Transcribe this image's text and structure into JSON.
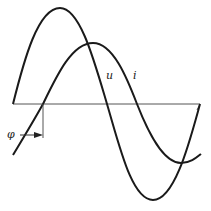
{
  "diagram": {
    "type": "phase-shift sine waveforms",
    "labels": {
      "voltage": "u",
      "current": "i",
      "phase": "φ"
    },
    "colors": {
      "line": "#1a1a1a",
      "axis": "#555555",
      "background": "#ffffff"
    },
    "axis": {
      "y": 104,
      "x_start": 13,
      "x_end": 200
    },
    "curves": [
      {
        "name": "u",
        "description": "leading sine wave, larger amplitude, starts at axis"
      },
      {
        "name": "i",
        "description": "lagging sine wave, smaller amplitude, shifted by φ"
      }
    ]
  }
}
